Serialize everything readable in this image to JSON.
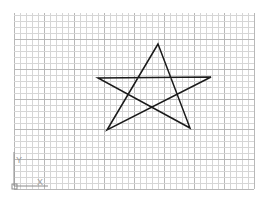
{
  "drawing": {
    "background": "#ffffff",
    "grid": {
      "left": 14,
      "top": 13,
      "right": 254,
      "bottom": 189,
      "minor_spacing": 6,
      "major_every": 5,
      "minor_color": "#d6d6d6",
      "major_color": "#b8b8b8"
    },
    "star": {
      "stroke": "#1a1a1a",
      "stroke_width": 1.5,
      "points": [
        [
          158,
          44
        ],
        [
          107,
          130
        ],
        [
          211,
          77
        ],
        [
          98,
          78
        ],
        [
          190,
          128
        ]
      ]
    },
    "ucs": {
      "y_label": "Y",
      "x_label": "X",
      "color": "#8c8c8c"
    }
  }
}
